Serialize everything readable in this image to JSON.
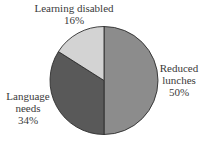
{
  "chart_data": {
    "type": "pie",
    "title": "",
    "categories": [
      "Reduced lunches",
      "Language needs",
      "Learning disabled"
    ],
    "values": [
      50,
      34,
      16
    ],
    "unit": "%",
    "colors": [
      "#8c8c8c",
      "#595959",
      "#d3d3d3"
    ],
    "start_angle_deg": 0,
    "direction": "clockwise from 12 o'clock",
    "legend": "none (direct labels)"
  },
  "labels": {
    "learning": {
      "line1": "Learning disabled",
      "line2": "16%"
    },
    "reduced": {
      "line1": "Reduced",
      "line2": "lunches",
      "line3": "50%"
    },
    "language": {
      "line1": "Language",
      "line2": "needs",
      "line3": "34%"
    }
  },
  "style": {
    "outline_color": "#2e2e2e"
  }
}
